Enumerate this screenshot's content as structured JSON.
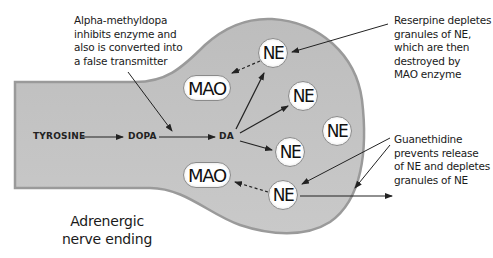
{
  "diagram": {
    "caption": "Adrenergic\nnerve ending",
    "colors": {
      "axoplasm_fill": "#c4c4c4",
      "membrane_outline": "#9a9a9a",
      "granule_fill": "#ffffff",
      "text": "#1a1a1a"
    },
    "pathway": {
      "tyrosine": "TYROSINE",
      "dopa": "DOPA",
      "da": "DA"
    },
    "enzymes": [
      {
        "label": "MAO",
        "position": "upper"
      },
      {
        "label": "MAO",
        "position": "lower"
      }
    ],
    "granules": [
      {
        "label": "NE",
        "position": "top"
      },
      {
        "label": "NE",
        "position": "upper-middle"
      },
      {
        "label": "NE",
        "position": "right"
      },
      {
        "label": "NE",
        "position": "lower-middle"
      },
      {
        "label": "NE",
        "position": "bottom"
      }
    ],
    "annotations": {
      "alpha_methyldopa": "Alpha-methyldopa\ninhibits enzyme and\nalso is converted into\na false transmitter",
      "reserpine": "Reserpine depletes\ngranules of NE,\nwhich are then\ndestroyed by\nMAO enzyme",
      "guanethidine": "Guanethidine\nprevents release\nof NE and depletes\ngranules of NE"
    }
  }
}
